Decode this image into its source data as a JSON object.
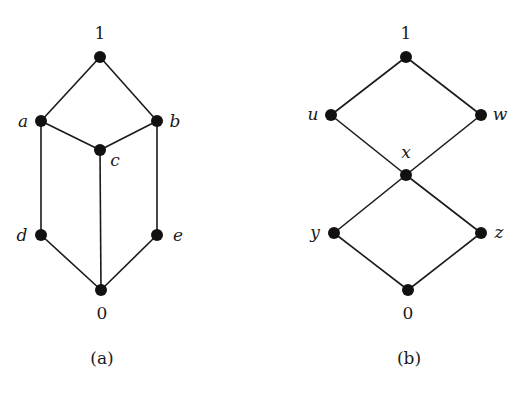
{
  "diagrams": [
    {
      "caption": "(a)",
      "nodes": [
        {
          "id": "1",
          "label": "1",
          "x": 100,
          "y": 57
        },
        {
          "id": "a",
          "label": "a",
          "x": 41,
          "y": 121
        },
        {
          "id": "b",
          "label": "b",
          "x": 157,
          "y": 121
        },
        {
          "id": "c",
          "label": "c",
          "x": 100,
          "y": 150
        },
        {
          "id": "d",
          "label": "d",
          "x": 41,
          "y": 235
        },
        {
          "id": "e",
          "label": "e",
          "x": 157,
          "y": 235
        },
        {
          "id": "0",
          "label": "0",
          "x": 101,
          "y": 290
        }
      ],
      "edges": [
        [
          "1",
          "a"
        ],
        [
          "1",
          "b"
        ],
        [
          "a",
          "c"
        ],
        [
          "b",
          "c"
        ],
        [
          "a",
          "d"
        ],
        [
          "b",
          "e"
        ],
        [
          "c",
          "0"
        ],
        [
          "d",
          "0"
        ],
        [
          "e",
          "0"
        ]
      ]
    },
    {
      "caption": "(b)",
      "nodes": [
        {
          "id": "1",
          "label": "1",
          "x": 406,
          "y": 57
        },
        {
          "id": "u",
          "label": "u",
          "x": 331,
          "y": 115
        },
        {
          "id": "w",
          "label": "w",
          "x": 481,
          "y": 115
        },
        {
          "id": "x",
          "label": "x",
          "x": 406,
          "y": 175
        },
        {
          "id": "y",
          "label": "y",
          "x": 334,
          "y": 233
        },
        {
          "id": "z",
          "label": "z",
          "x": 481,
          "y": 233
        },
        {
          "id": "0",
          "label": "0",
          "x": 408,
          "y": 290
        }
      ],
      "edges": [
        [
          "1",
          "u"
        ],
        [
          "1",
          "w"
        ],
        [
          "u",
          "x"
        ],
        [
          "w",
          "x"
        ],
        [
          "x",
          "y"
        ],
        [
          "x",
          "z"
        ],
        [
          "y",
          "0"
        ],
        [
          "z",
          "0"
        ]
      ]
    }
  ],
  "labels": {
    "a_top": "1",
    "a_a": "a",
    "a_b": "b",
    "a_c": "c",
    "a_d": "d",
    "a_e": "e",
    "a_bottom": "0",
    "a_caption": "(a)",
    "b_top": "1",
    "b_u": "u",
    "b_w": "w",
    "b_x": "x",
    "b_y": "y",
    "b_z": "z",
    "b_bottom": "0",
    "b_caption": "(b)"
  }
}
